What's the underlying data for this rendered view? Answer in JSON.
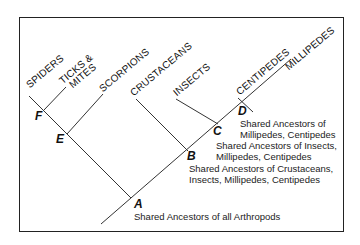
{
  "diagram": {
    "colors": {
      "line": "#333333",
      "text": "#111111",
      "frame": "#222222"
    },
    "taxa": [
      {
        "id": "spiders",
        "label": "SPIDERS"
      },
      {
        "id": "ticks",
        "label": "TICKS &",
        "label2": "MITES"
      },
      {
        "id": "scorpions",
        "label": "SCORPIONS"
      },
      {
        "id": "crustaceans",
        "label": "CRUSTACEANS"
      },
      {
        "id": "insects",
        "label": "INSECTS"
      },
      {
        "id": "centipedes",
        "label": "CENTIPEDES"
      },
      {
        "id": "millipedes",
        "label": "MILLIPEDES"
      }
    ],
    "nodes": [
      {
        "id": "A",
        "label": "A",
        "description": [
          "Shared Ancestors of all Arthropods"
        ]
      },
      {
        "id": "B",
        "label": "B",
        "description": [
          "Shared Ancestors of Crustaceans,",
          "Insects, Millipedes, Centipedes"
        ]
      },
      {
        "id": "C",
        "label": "C",
        "description": [
          "Shared Ancestors of Insects,",
          "Millipedes, Centipedes"
        ]
      },
      {
        "id": "D",
        "label": "D",
        "description": [
          "Shared Ancestors of",
          "Millipedes, Centipedes"
        ]
      },
      {
        "id": "E",
        "label": "E",
        "description": []
      },
      {
        "id": "F",
        "label": "F",
        "description": []
      }
    ]
  }
}
